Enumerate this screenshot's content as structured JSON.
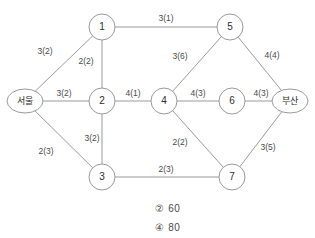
{
  "figure": {
    "type": "network-graph",
    "nodes": [
      {
        "id": "seoul",
        "label": "서울",
        "shape": "ellipse",
        "x": 25,
        "y": 101,
        "rx": 18,
        "ry": 12
      },
      {
        "id": "n1",
        "label": "1",
        "shape": "circle",
        "x": 102,
        "y": 27,
        "r": 13
      },
      {
        "id": "n2",
        "label": "2",
        "shape": "circle",
        "x": 102,
        "y": 101,
        "r": 13
      },
      {
        "id": "n3",
        "label": "3",
        "shape": "circle",
        "x": 102,
        "y": 177,
        "r": 13
      },
      {
        "id": "n4",
        "label": "4",
        "shape": "circle",
        "x": 164,
        "y": 101,
        "r": 13
      },
      {
        "id": "n5",
        "label": "5",
        "shape": "circle",
        "x": 230,
        "y": 27,
        "r": 13
      },
      {
        "id": "n6",
        "label": "6",
        "shape": "circle",
        "x": 232,
        "y": 101,
        "r": 13
      },
      {
        "id": "n7",
        "label": "7",
        "shape": "circle",
        "x": 232,
        "y": 177,
        "r": 13
      },
      {
        "id": "busan",
        "label": "부산",
        "shape": "ellipse",
        "x": 290,
        "y": 101,
        "rx": 18,
        "ry": 12
      }
    ],
    "edges": [
      {
        "id": "e-seoul-1",
        "from": "seoul",
        "to": "n1",
        "label": "3(2)",
        "capacity": 3,
        "flow": 2,
        "label_x": 45,
        "label_y": 52
      },
      {
        "id": "e-seoul-2",
        "from": "seoul",
        "to": "n2",
        "label": "3(2)",
        "capacity": 3,
        "flow": 2,
        "label_x": 64,
        "label_y": 94
      },
      {
        "id": "e-seoul-3",
        "from": "seoul",
        "to": "n3",
        "label": "2(3)",
        "capacity": 2,
        "flow": 3,
        "label_x": 46,
        "label_y": 152
      },
      {
        "id": "e-1-2",
        "from": "n1",
        "to": "n2",
        "label": "2(2)",
        "capacity": 2,
        "flow": 2,
        "label_x": 86,
        "label_y": 62
      },
      {
        "id": "e-1-5",
        "from": "n1",
        "to": "n5",
        "label": "3(1)",
        "capacity": 3,
        "flow": 1,
        "label_x": 166,
        "label_y": 19
      },
      {
        "id": "e-2-3",
        "from": "n2",
        "to": "n3",
        "label": "3(2)",
        "capacity": 3,
        "flow": 2,
        "label_x": 92,
        "label_y": 139
      },
      {
        "id": "e-2-4",
        "from": "n2",
        "to": "n4",
        "label": "4(1)",
        "capacity": 4,
        "flow": 1,
        "label_x": 133,
        "label_y": 94
      },
      {
        "id": "e-4-5",
        "from": "n4",
        "to": "n5",
        "label": "3(6)",
        "capacity": 3,
        "flow": 6,
        "label_x": 180,
        "label_y": 57
      },
      {
        "id": "e-4-6",
        "from": "n4",
        "to": "n6",
        "label": "4(3)",
        "capacity": 4,
        "flow": 3,
        "label_x": 198,
        "label_y": 94
      },
      {
        "id": "e-4-7",
        "from": "n4",
        "to": "n7",
        "label": "2(2)",
        "capacity": 2,
        "flow": 2,
        "label_x": 180,
        "label_y": 143
      },
      {
        "id": "e-5-busan",
        "from": "n5",
        "to": "busan",
        "label": "4(4)",
        "capacity": 4,
        "flow": 4,
        "label_x": 272,
        "label_y": 56
      },
      {
        "id": "e-6-busan",
        "from": "n6",
        "to": "busan",
        "label": "4(3)",
        "capacity": 4,
        "flow": 3,
        "label_x": 261,
        "label_y": 94
      },
      {
        "id": "e-7-busan",
        "from": "n7",
        "to": "busan",
        "label": "3(5)",
        "capacity": 3,
        "flow": 5,
        "label_x": 268,
        "label_y": 148
      },
      {
        "id": "e-3-7",
        "from": "n3",
        "to": "n7",
        "label": "2(3)",
        "capacity": 2,
        "flow": 3,
        "label_x": 166,
        "label_y": 170
      }
    ]
  },
  "choices": [
    {
      "number": "②",
      "value": "60",
      "x": 155,
      "y": 203
    },
    {
      "number": "④",
      "value": "80",
      "x": 155,
      "y": 222
    }
  ]
}
